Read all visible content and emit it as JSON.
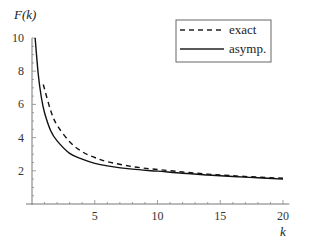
{
  "chart_data": {
    "type": "line",
    "title": "",
    "xlabel": "k",
    "ylabel": "F(k)",
    "xlim": [
      0,
      20
    ],
    "ylim": [
      0,
      10
    ],
    "grid": false,
    "legend_position": "upper right",
    "x_ticks": [
      5,
      10,
      15,
      20
    ],
    "y_ticks": [
      2,
      4,
      6,
      8,
      10
    ],
    "series": [
      {
        "name": "exact",
        "style": "dashed",
        "x": [
          0.9,
          1.5,
          2,
          3,
          4,
          5,
          6,
          8,
          10,
          12,
          14,
          16,
          18,
          20
        ],
        "y": [
          7.2,
          5.6,
          4.75,
          3.75,
          3.15,
          2.8,
          2.55,
          2.25,
          2.08,
          1.93,
          1.8,
          1.7,
          1.62,
          1.55
        ]
      },
      {
        "name": "asymp.",
        "style": "solid",
        "x": [
          0.25,
          0.5,
          0.75,
          1,
          1.5,
          2,
          3,
          4,
          5,
          6,
          8,
          10,
          12,
          14,
          16,
          18,
          20
        ],
        "y": [
          10,
          7.8,
          6.4,
          5.5,
          4.4,
          3.8,
          3.05,
          2.7,
          2.45,
          2.3,
          2.1,
          1.98,
          1.85,
          1.75,
          1.66,
          1.58,
          1.5
        ]
      }
    ]
  },
  "labels": {
    "ylabel": "F(k)",
    "xlabel": "k",
    "x_tick_labels": [
      "5",
      "10",
      "15",
      "20"
    ],
    "y_tick_labels": [
      "2",
      "4",
      "6",
      "8",
      "10"
    ],
    "legend": [
      "exact",
      "asymp."
    ]
  }
}
